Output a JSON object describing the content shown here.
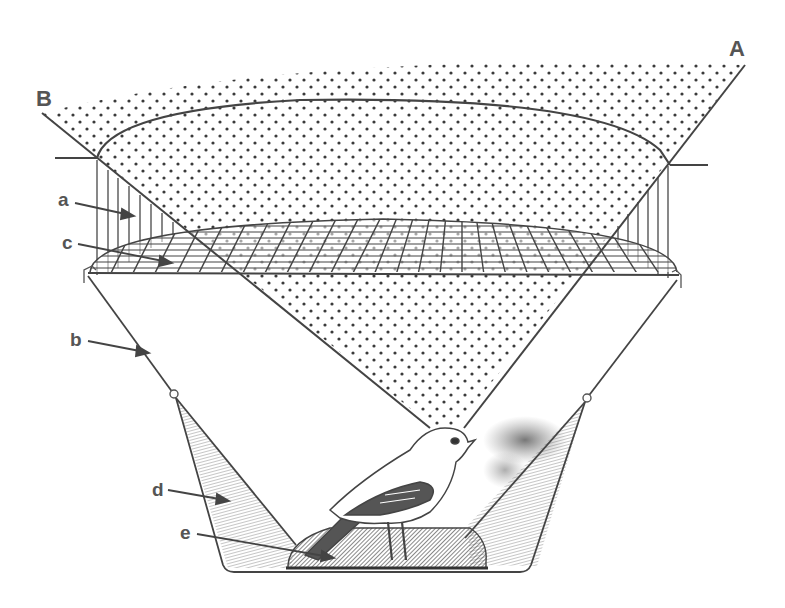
{
  "diagram": {
    "colors": {
      "ink": "#4a4a4a",
      "label": "#555555",
      "stipple": "#3a3a3a",
      "shade": "#8a8a8a",
      "background": "#ffffff"
    },
    "labels": {
      "A": "A",
      "B": "B",
      "a": "a",
      "b": "b",
      "c": "c",
      "d": "d",
      "e": "e"
    },
    "parts": [
      {
        "key": "A",
        "meaning": "sight line A"
      },
      {
        "key": "B",
        "meaning": "sight line B"
      },
      {
        "key": "a",
        "meaning": "cylindrical screen wall"
      },
      {
        "key": "b",
        "meaning": "funnel wall"
      },
      {
        "key": "c",
        "meaning": "wire mesh net cover"
      },
      {
        "key": "d",
        "meaning": "shaded inner funnel"
      },
      {
        "key": "e",
        "meaning": "ink pad / base platform"
      }
    ]
  }
}
